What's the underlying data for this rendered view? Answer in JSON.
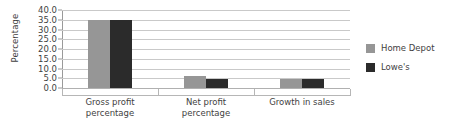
{
  "chart_data": {
    "type": "bar",
    "title": "",
    "subtitle": "",
    "xlabel": "",
    "ylabel": "Percentage",
    "categories": [
      "Gross profit percentage",
      "Net profit percentage",
      "Growth in sales"
    ],
    "category_lines": [
      [
        "Gross profit",
        "percentage"
      ],
      [
        "Net profit",
        "percentage"
      ],
      [
        "Growth in sales"
      ]
    ],
    "series": [
      {
        "name": "Home Depot",
        "color": "#969696",
        "values": [
          34.7,
          6.0,
          4.6
        ]
      },
      {
        "name": "Lowe's",
        "color": "#2b2b2b",
        "values": [
          34.7,
          4.6,
          4.6
        ]
      }
    ],
    "ylim": [
      0.0,
      40.0
    ],
    "ytick_step": 5.0,
    "ytick_labels": [
      "0.0",
      "5.0",
      "10.0",
      "15.0",
      "20.0",
      "25.0",
      "30.0",
      "35.0",
      "40.0"
    ],
    "ytick_values": [
      0.0,
      5.0,
      10.0,
      15.0,
      20.0,
      25.0,
      30.0,
      35.0,
      40.0
    ],
    "grid": true,
    "grid_axis": "y",
    "legend_position": "right",
    "legend_entries": [
      "Home Depot",
      "Lowe's"
    ],
    "background_color": "#ffffff",
    "gridline_color": "#c9c9c9",
    "axis_color": "#9a9a9a",
    "text_color": "#3f3f3f"
  }
}
